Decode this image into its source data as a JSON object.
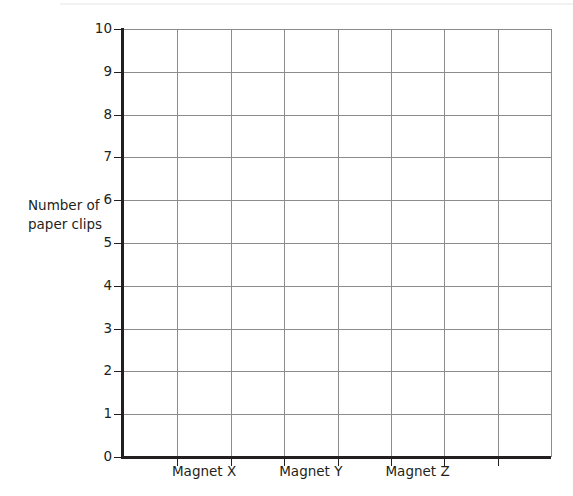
{
  "page": {
    "background_color": "#ffffff",
    "top_rule_color": "#f2f2f3"
  },
  "chart_data": {
    "type": "bar",
    "title": "",
    "subtitle": "",
    "xlabel": "",
    "ylabel": "Number of paper clips",
    "ylabel_lines": [
      "Number of",
      "paper clips"
    ],
    "categories": [
      "Magnet X",
      "Magnet Y",
      "Magnet Z"
    ],
    "values": [
      null,
      null,
      null
    ],
    "series": [
      {
        "name": "",
        "values": [
          null,
          null,
          null
        ]
      }
    ],
    "ylim": [
      0,
      10
    ],
    "y_ticks": [
      0,
      1,
      2,
      3,
      4,
      5,
      6,
      7,
      8,
      9,
      10
    ],
    "y_tick_labels": [
      "0",
      "1",
      "2",
      "3",
      "4",
      "5",
      "6",
      "7",
      "8",
      "9",
      "10"
    ],
    "y_major_step": 1,
    "x_tick_count": 7,
    "grid": true,
    "grid_color": "#8c8c8c",
    "axis_color": "#231f20",
    "legend": null,
    "legend_position": "none",
    "annotations": [],
    "note": "Empty grid: axes and gridlines drawn, no bars plotted."
  },
  "axes": {
    "y_title_lines": [
      "Number of",
      "paper clips"
    ],
    "y_tick_labels": [
      "10",
      "9",
      "8",
      "7",
      "6",
      "5",
      "4",
      "3",
      "2",
      "1",
      "0"
    ],
    "x_tick_labels": [
      "Magnet X",
      "Magnet Y",
      "Magnet Z"
    ]
  }
}
